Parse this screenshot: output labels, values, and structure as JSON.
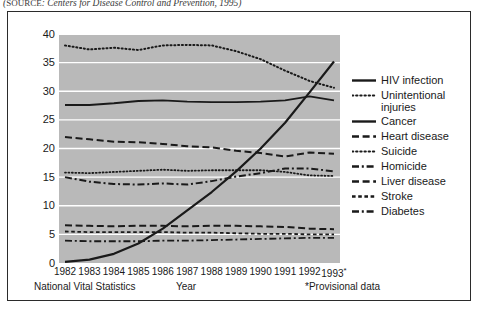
{
  "source_note": {
    "prefix": "SOURCE",
    "text": ": Centers for Disease Control and Prevention, 1995)",
    "open_paren": "("
  },
  "annotations": {
    "left": "National Vital Statistics",
    "center": "Year",
    "right": "*Provisional data"
  },
  "colors": {
    "plot_background": "#b9b9b9",
    "gridline": "#ffffff",
    "ink": "#1a1a1a",
    "frame": "#2b2b2b"
  },
  "chart_data": {
    "type": "line",
    "title": "",
    "xlabel": "Year",
    "ylabel": "Deaths per 100,000 population",
    "ylim": [
      0,
      40
    ],
    "ytick_values": [
      0,
      5,
      10,
      15,
      20,
      25,
      30,
      35,
      40
    ],
    "ytick_labels": [
      "0",
      "5",
      "10",
      "15",
      "20",
      "25",
      "30",
      "35",
      "40"
    ],
    "grid": true,
    "grid_axis": "y",
    "legend_position": "right",
    "x": [
      1982,
      1983,
      1984,
      1985,
      1986,
      1987,
      1988,
      1989,
      1990,
      1991,
      1992,
      1993
    ],
    "categories": [
      "1982",
      "1983",
      "1984",
      "1985",
      "1986",
      "1987",
      "1988",
      "1989",
      "1990",
      "1991",
      "1992",
      "1993*"
    ],
    "xtick_labels": [
      "1982",
      "1983",
      "1984",
      "1985",
      "1986",
      "1987",
      "1988",
      "1989",
      "1990",
      "1991",
      "1992",
      "1993*"
    ],
    "series": [
      {
        "name": "HIV infection",
        "style": "solid",
        "width": 2.2,
        "values": [
          0.2,
          0.6,
          1.6,
          3.4,
          6.0,
          9.2,
          12.4,
          16.0,
          20.0,
          24.5,
          29.8,
          35.2
        ]
      },
      {
        "name": "Unintentional injuries",
        "style": "dotted",
        "width": 2.0,
        "values": [
          38.0,
          37.3,
          37.6,
          37.2,
          38.0,
          38.1,
          38.0,
          37.0,
          35.6,
          33.6,
          31.8,
          30.6
        ]
      },
      {
        "name": "Cancer",
        "style": "solid",
        "width": 1.8,
        "values": [
          27.6,
          27.6,
          27.9,
          28.3,
          28.4,
          28.2,
          28.1,
          28.1,
          28.2,
          28.4,
          29.1,
          28.4
        ]
      },
      {
        "name": "Heart disease",
        "style": "dashed",
        "width": 2.0,
        "values": [
          22.0,
          21.6,
          21.2,
          21.1,
          20.8,
          20.4,
          20.2,
          19.6,
          19.2,
          18.6,
          19.3,
          19.1
        ]
      },
      {
        "name": "Suicide",
        "style": "dotted",
        "width": 1.8,
        "values": [
          15.8,
          15.7,
          15.9,
          16.1,
          16.3,
          16.1,
          16.2,
          16.2,
          16.2,
          15.9,
          15.3,
          15.2
        ]
      },
      {
        "name": "Homicide",
        "style": "dashdot",
        "width": 2.0,
        "values": [
          15.0,
          14.2,
          13.8,
          13.7,
          13.9,
          13.7,
          14.3,
          15.1,
          15.7,
          16.5,
          16.5,
          16.0
        ]
      },
      {
        "name": "Liver disease",
        "style": "dashed",
        "width": 2.0,
        "values": [
          6.6,
          6.5,
          6.4,
          6.5,
          6.5,
          6.4,
          6.5,
          6.5,
          6.4,
          6.3,
          6.0,
          5.9
        ]
      },
      {
        "name": "Stroke",
        "style": "shortdash",
        "width": 1.8,
        "values": [
          5.5,
          5.4,
          5.4,
          5.4,
          5.4,
          5.3,
          5.3,
          5.2,
          5.1,
          5.1,
          5.0,
          5.0
        ]
      },
      {
        "name": "Diabetes",
        "style": "dashdot",
        "width": 1.8,
        "values": [
          3.9,
          3.8,
          3.8,
          3.8,
          3.9,
          3.9,
          4.0,
          4.1,
          4.2,
          4.3,
          4.4,
          4.4
        ]
      }
    ]
  },
  "legend": {
    "items": [
      {
        "label": "HIV infection",
        "style": "solid",
        "width": 2.4
      },
      {
        "label": "Unintentional injuries",
        "style": "dotted",
        "width": 2.2
      },
      {
        "label": "Cancer",
        "style": "solid",
        "width": 2.4
      },
      {
        "label": "Heart disease",
        "style": "dashed",
        "width": 2.4
      },
      {
        "label": "Suicide",
        "style": "dotted",
        "width": 2.2
      },
      {
        "label": "Homicide",
        "style": "dashdot",
        "width": 2.4
      },
      {
        "label": "Liver disease",
        "style": "dashed",
        "width": 2.4
      },
      {
        "label": "Stroke",
        "style": "shortdash",
        "width": 2.4
      },
      {
        "label": "Diabetes",
        "style": "dashdot",
        "width": 2.4
      }
    ]
  }
}
